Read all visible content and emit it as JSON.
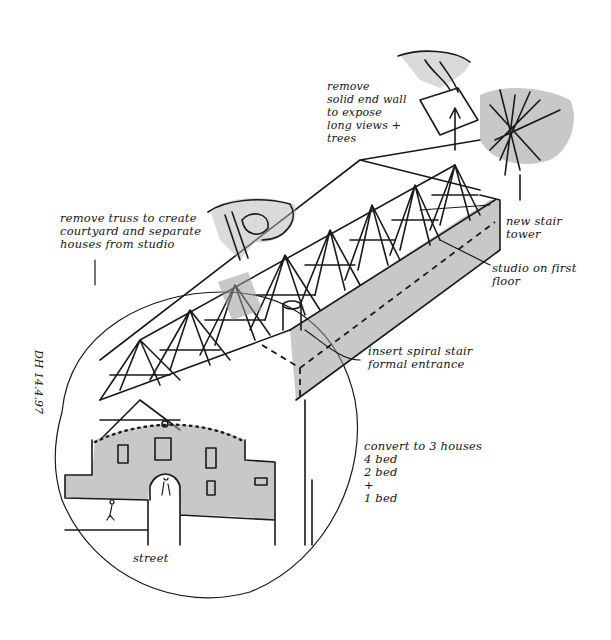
{
  "drawing": {
    "type": "hand-drawn isometric architectural sketch",
    "subject": "barn conversion with exposed roof trusses, courtyard and separated houses",
    "ink_color": "#1a1a1a",
    "wash_color": "#9a9a9a",
    "background": "#ffffff"
  },
  "annotations": {
    "remove_end_wall": "remove\nsolid end wall\nto expose\nlong views +\ntrees",
    "remove_truss": "remove truss to create\ncourtyard and separate\nhouses from studio",
    "new_stair_tower": "new stair\ntower",
    "studio_first_floor": "studio on first\nfloor",
    "spiral_stair": "insert spiral stair\nformal entrance",
    "convert_houses": "convert to 3 houses\n4 bed\n2 bed\n+\n1 bed",
    "street": "street",
    "date_signature": "DH 14.4.97"
  },
  "elements": [
    {
      "name": "barn-roof-trusses",
      "description": "exposed timber roof trusses along barn length"
    },
    {
      "name": "gable-end-facade",
      "description": "shaded masonry gable with arched entrance and windows"
    },
    {
      "name": "studio-wing",
      "description": "shaded long side wall with dashed first-floor line"
    },
    {
      "name": "hand-removing-truss",
      "description": "hand lifting a truss out"
    },
    {
      "name": "hand-removing-wall",
      "description": "hand lifting end wall away, arrow up"
    },
    {
      "name": "tree",
      "description": "shaded tree at far end"
    },
    {
      "name": "spiral-stair-cylinder",
      "description": "small cylinder stair near courtyard"
    },
    {
      "name": "figures",
      "description": "small human figures at street level"
    },
    {
      "name": "circle-frame",
      "description": "large circle framing the front of building"
    }
  ]
}
